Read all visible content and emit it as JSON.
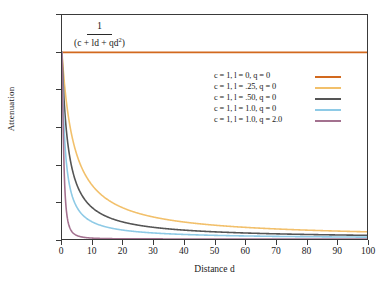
{
  "figure": {
    "background_color": "#ffffff",
    "frame_color": "#3a3a3a"
  },
  "formula": {
    "numerator": "1",
    "denominator_prefix": "(c + ld + qd",
    "denominator_exponent": "2",
    "denominator_suffix": ")"
  },
  "axes": {
    "x_title": "Distance d",
    "y_title": "Attenuation",
    "x_ticks": [
      "0",
      "10",
      "20",
      "30",
      "40",
      "50",
      "60",
      "70",
      "80",
      "90",
      "100"
    ],
    "y_ticks": [
      "1.2",
      "1",
      "0.8",
      "0.6",
      "0.4",
      "0.2",
      "0"
    ]
  },
  "legend": {
    "entries": [
      {
        "label": "c = 1, l = 0,   q = 0",
        "color": "#d2691e"
      },
      {
        "label": "c = 1, l = .25, q = 0",
        "color": "#f2c06b"
      },
      {
        "label": "c = 1, l = .50, q = 0",
        "color": "#555555"
      },
      {
        "label": "c = 1, l = 1.0, q = 0",
        "color": "#8ecae6"
      },
      {
        "label": "c = 1, l = 1.0, q = 2.0",
        "color": "#a3718f"
      }
    ]
  },
  "chart_data": {
    "type": "line",
    "title": "",
    "subtitle": "",
    "xlabel": "Distance d",
    "ylabel": "Attenuation",
    "xlim": [
      0,
      100
    ],
    "ylim": [
      0,
      1.2
    ],
    "grid": false,
    "legend_position": "inside-upper-right",
    "annotation": "1 / (c + ld + qd^2)",
    "x": [
      0,
      1,
      2,
      3,
      4,
      5,
      6,
      8,
      10,
      12,
      15,
      20,
      25,
      30,
      35,
      40,
      45,
      50,
      55,
      60,
      65,
      70,
      75,
      80,
      85,
      90,
      95,
      100
    ],
    "series": [
      {
        "name": "c = 1, l = 0,   q = 0",
        "color": "#d2691e",
        "params": {
          "c": 1,
          "l": 0,
          "q": 0
        },
        "values": [
          1,
          1,
          1,
          1,
          1,
          1,
          1,
          1,
          1,
          1,
          1,
          1,
          1,
          1,
          1,
          1,
          1,
          1,
          1,
          1,
          1,
          1,
          1,
          1,
          1,
          1,
          1,
          1
        ]
      },
      {
        "name": "c = 1, l = .25, q = 0",
        "color": "#f2c06b",
        "params": {
          "c": 1,
          "l": 0.25,
          "q": 0
        },
        "values": [
          1,
          0.8,
          0.667,
          0.571,
          0.5,
          0.444,
          0.4,
          0.333,
          0.286,
          0.25,
          0.211,
          0.167,
          0.138,
          0.118,
          0.103,
          0.091,
          0.082,
          0.074,
          0.067,
          0.063,
          0.058,
          0.054,
          0.051,
          0.048,
          0.045,
          0.043,
          0.041,
          0.039
        ]
      },
      {
        "name": "c = 1, l = .50, q = 0",
        "color": "#555555",
        "params": {
          "c": 1,
          "l": 0.5,
          "q": 0
        },
        "values": [
          1,
          0.667,
          0.5,
          0.4,
          0.333,
          0.286,
          0.25,
          0.2,
          0.167,
          0.143,
          0.118,
          0.091,
          0.074,
          0.063,
          0.054,
          0.048,
          0.043,
          0.039,
          0.036,
          0.032,
          0.03,
          0.028,
          0.026,
          0.024,
          0.023,
          0.022,
          0.021,
          0.02
        ]
      },
      {
        "name": "c = 1, l = 1.0, q = 0",
        "color": "#8ecae6",
        "params": {
          "c": 1,
          "l": 1,
          "q": 0
        },
        "values": [
          1,
          0.5,
          0.333,
          0.25,
          0.2,
          0.167,
          0.143,
          0.111,
          0.091,
          0.077,
          0.063,
          0.048,
          0.038,
          0.032,
          0.028,
          0.024,
          0.022,
          0.02,
          0.018,
          0.016,
          0.015,
          0.014,
          0.013,
          0.012,
          0.012,
          0.011,
          0.01,
          0.01
        ]
      },
      {
        "name": "c = 1, l = 1.0, q = 2.0",
        "color": "#a3718f",
        "params": {
          "c": 1,
          "l": 1,
          "q": 2
        },
        "values": [
          1,
          0.25,
          0.091,
          0.045,
          0.027,
          0.018,
          0.013,
          0.0073,
          0.0048,
          0.0033,
          0.0022,
          0.0012,
          0.00079,
          0.00055,
          0.0004,
          0.00031,
          0.00024,
          0.0002,
          0.00016,
          0.00014,
          0.00012,
          0.0001,
          9e-05,
          8e-05,
          7e-05,
          6e-05,
          6e-05,
          5e-05
        ]
      }
    ]
  }
}
